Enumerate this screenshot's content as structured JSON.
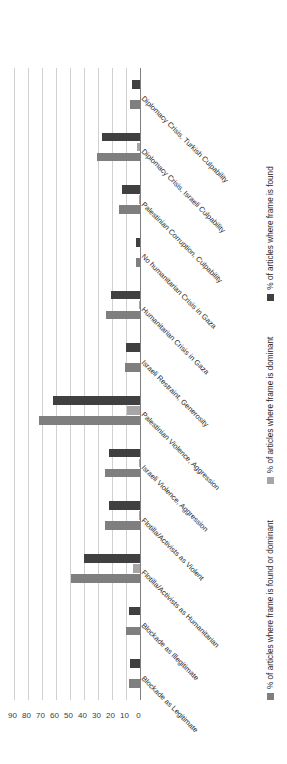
{
  "chart_data": {
    "type": "bar",
    "orientation": "horizontal",
    "title": "",
    "xlabel": "",
    "ylabel": "",
    "xlim": [
      0,
      90
    ],
    "grid": true,
    "legend_position": "bottom",
    "ticks": [
      "0",
      "10",
      "20",
      "30",
      "40",
      "50",
      "60",
      "70",
      "80",
      "90"
    ],
    "tick_values": [
      0,
      10,
      20,
      30,
      40,
      50,
      60,
      70,
      80,
      90
    ],
    "categories": [
      "Blockade as Legitimate",
      "Blockade as Illegitimate",
      "Flotilla/Activists as Humanitarian",
      "Flotilla/Activists as Violent",
      "Israeli Violence, Aggression",
      "Palestinian Violence, Aggression",
      "Israeli Restraint, Generosity",
      "Humanitarian Crisis in Gaza",
      "No humanitarian Crisis in Gaza",
      "Palestinian Corruption, Culpability",
      "Diplomacy Crisis, Israeli Culpability",
      "Diplomacy Crisis, Turkish Culpability"
    ],
    "series": [
      {
        "name": "% of articles where frame is found",
        "color": "#404040",
        "values": [
          7,
          8,
          40,
          22,
          22,
          62,
          10,
          21,
          3,
          13,
          27,
          6
        ]
      },
      {
        "name": "% of articles where frame is dominant",
        "color": "#a6a6a6",
        "values": [
          0,
          0,
          5,
          1,
          1,
          9,
          0,
          1,
          0,
          1,
          2,
          0
        ]
      },
      {
        "name": "% of articles where frame is found or dominant",
        "color": "#7f7f7f",
        "values": [
          8,
          10,
          49,
          25,
          25,
          72,
          11,
          24,
          3,
          15,
          31,
          7
        ]
      }
    ]
  },
  "legend": {
    "items": [
      {
        "label": "% of articles where frame is found or dominant",
        "color": "#7f7f7f",
        "swatch_name": "legend-swatch-found-or-dominant"
      },
      {
        "label": "% of articles where frame is dominant",
        "color": "#a6a6a6",
        "swatch_name": "legend-swatch-dominant"
      },
      {
        "label": "% of articles where frame is found",
        "color": "#404040",
        "swatch_name": "legend-swatch-found"
      }
    ]
  }
}
